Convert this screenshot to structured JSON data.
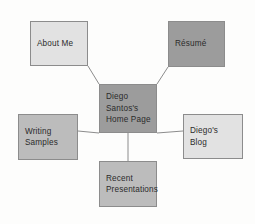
{
  "diagram": {
    "type": "site-map",
    "background_color": "#fdfdfc",
    "border_color": "#8c8c8c",
    "text_color": "#2b2b2b",
    "fills": {
      "light": "#e2e2e2",
      "mid": "#bcbcbc",
      "dark": "#9c9c9c"
    },
    "nodes": [
      {
        "id": "about-me",
        "lines": [
          "About Me"
        ],
        "fill": "#e2e2e2",
        "x": 30,
        "y": 21,
        "w": 58,
        "h": 45
      },
      {
        "id": "resume",
        "lines": [
          "Résumé"
        ],
        "fill": "#9c9c9c",
        "x": 168,
        "y": 21,
        "w": 57,
        "h": 46
      },
      {
        "id": "home-page",
        "lines": [
          "Diego",
          "Santos's",
          "Home Page"
        ],
        "fill": "#9c9c9c",
        "x": 99,
        "y": 84,
        "w": 58,
        "h": 49
      },
      {
        "id": "writing-samples",
        "lines": [
          "Writing",
          "Samples"
        ],
        "fill": "#bcbcbc",
        "x": 18,
        "y": 114,
        "w": 60,
        "h": 46
      },
      {
        "id": "diegos-blog",
        "lines": [
          "Diego's",
          "Blog"
        ],
        "fill": "#e2e2e2",
        "x": 183,
        "y": 114,
        "w": 60,
        "h": 45
      },
      {
        "id": "recent-presentations",
        "lines": [
          "Recent",
          "Presentations"
        ],
        "fill": "#bcbcbc",
        "x": 99,
        "y": 161,
        "w": 58,
        "h": 46
      }
    ],
    "connectors": [
      {
        "id": "home-to-about-me",
        "from": "home-page",
        "to": "about-me",
        "x1": 99,
        "y1": 84,
        "x2": 88,
        "y2": 66
      },
      {
        "id": "home-to-resume",
        "from": "home-page",
        "to": "resume",
        "x1": 157,
        "y1": 84,
        "x2": 168,
        "y2": 67
      },
      {
        "id": "home-to-writing-samples",
        "from": "home-page",
        "to": "writing-samples",
        "x1": 99,
        "y1": 133,
        "x2": 78,
        "y2": 131
      },
      {
        "id": "home-to-diegos-blog",
        "from": "home-page",
        "to": "diegos-blog",
        "x1": 157,
        "y1": 133,
        "x2": 183,
        "y2": 131
      },
      {
        "id": "home-to-recent-presentations",
        "from": "home-page",
        "to": "recent-presentations",
        "x1": 128,
        "y1": 133,
        "x2": 128,
        "y2": 161
      }
    ]
  }
}
